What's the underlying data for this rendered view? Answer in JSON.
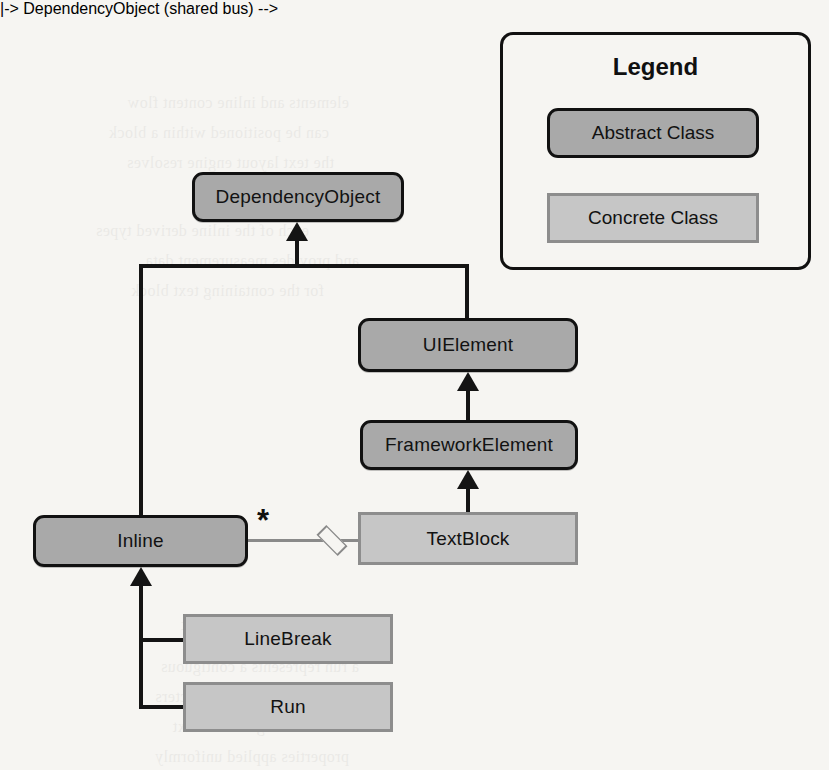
{
  "diagram": {
    "type": "uml-class-diagram",
    "background_color": "#f6f5f2",
    "abstract_fill": "#a9a9a9",
    "abstract_border": "#111111",
    "concrete_fill": "#c6c6c6",
    "concrete_border": "#8d8d8d",
    "line_color": "#141414",
    "association_color": "#8a8a8a",
    "nodes": [
      {
        "id": "dependencyobject",
        "label": "DependencyObject",
        "kind": "abstract"
      },
      {
        "id": "uielement",
        "label": "UIElement",
        "kind": "abstract"
      },
      {
        "id": "frameworkelement",
        "label": "FrameworkElement",
        "kind": "abstract"
      },
      {
        "id": "inline",
        "label": "Inline",
        "kind": "abstract"
      },
      {
        "id": "textblock",
        "label": "TextBlock",
        "kind": "concrete"
      },
      {
        "id": "linebreak",
        "label": "LineBreak",
        "kind": "concrete"
      },
      {
        "id": "run",
        "label": "Run",
        "kind": "concrete"
      }
    ],
    "relationships": [
      {
        "from": "uielement",
        "to": "dependencyobject",
        "type": "generalization"
      },
      {
        "from": "inline",
        "to": "dependencyobject",
        "type": "generalization"
      },
      {
        "from": "frameworkelement",
        "to": "uielement",
        "type": "generalization"
      },
      {
        "from": "textblock",
        "to": "frameworkelement",
        "type": "generalization"
      },
      {
        "from": "linebreak",
        "to": "inline",
        "type": "generalization"
      },
      {
        "from": "run",
        "to": "inline",
        "type": "generalization"
      },
      {
        "from": "textblock",
        "to": "inline",
        "type": "aggregation",
        "multiplicity": "*"
      }
    ],
    "multiplicity_label": "*"
  },
  "legend": {
    "title": "Legend",
    "items": [
      {
        "label": "Abstract Class",
        "kind": "abstract"
      },
      {
        "label": "Concrete Class",
        "kind": "concrete"
      }
    ]
  },
  "bleed_text": {
    "lines": [
      "elements and inline content flow",
      "can be positioned within a block",
      "the text layout engine resolves",
      "each of the inline derived types",
      "and provides measurement data",
      "for the containing text block",
      "Inline Elements and Content",
      "a run represents a contiguous",
      "sequence of formatted characters",
      "that share a single set of text",
      "properties applied uniformly"
    ]
  }
}
